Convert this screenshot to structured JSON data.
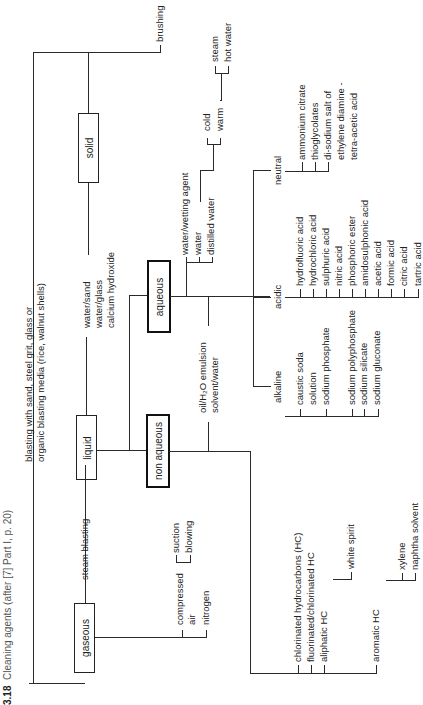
{
  "caption": {
    "figure_number": "3.18",
    "text": "Cleaning agents (after [7] Part I, p. 20)"
  },
  "root": {
    "categories": [
      {
        "label": "solid",
        "children": [
          "brushing",
          "blasting with sand, steel grit, glass or",
          "organic blasting media (rice, walnut shells)"
        ]
      },
      {
        "label": "liquid",
        "direct_children": [
          "water/sand",
          "water/glass",
          "calcium hydroxide"
        ],
        "subgroups": [
          {
            "label": "aqueous",
            "water_items": [
              "water/wetting agent",
              "water",
              "distilled water"
            ],
            "temperature": [
              "cold",
              "warm"
            ],
            "temperature_children": [
              "steam",
              "hot water"
            ],
            "types": {
              "neutral": {
                "label": "neutral",
                "items": [
                  "ammonium citrate",
                  "thioglycolates",
                  "di-sodium salt of",
                  "ethylene diamine -",
                  "tetra-acetic acid"
                ]
              },
              "acidic": {
                "label": "acidic",
                "items": [
                  "hydrofluoric acid",
                  "hydrochloric acid",
                  "sulphuric acid",
                  "nitric acid",
                  "phosphoric ester",
                  "amidosulphonic acid",
                  "acetic acid",
                  "formic acid",
                  "citric acid",
                  "tartric acid"
                ]
              },
              "alkaline": {
                "label": "alkaline",
                "items": [
                  "caustic soda",
                  "solution",
                  "sodium phosphate",
                  "sodium polyphosphate",
                  "sodium silicate",
                  "sodium gluconate"
                ]
              }
            },
            "emulsion": [
              "oil/H₂O emulsion",
              "solvent/water"
            ]
          },
          {
            "label": "non aqueous",
            "items": [
              "chlorinated hydrocarbons (HC)",
              "fluorinated/chlorinated HC",
              "aliphatic HC",
              "aromatic HC"
            ],
            "aliphatic_children": [
              "white spirit"
            ],
            "aromatic_children": [
              "xylene",
              "naphtha solvent"
            ]
          }
        ]
      },
      {
        "label": "gaseous",
        "direct_children": [
          "steam blasting"
        ],
        "items": [
          "compressed",
          "air",
          "nitrogen"
        ],
        "air_children": [
          "suction",
          "blowing"
        ]
      }
    ]
  }
}
